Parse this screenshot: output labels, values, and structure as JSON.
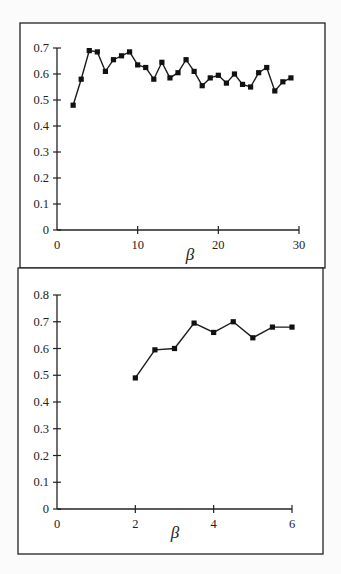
{
  "chart_data": [
    {
      "type": "line",
      "title": "",
      "xlabel": "β",
      "ylabel": "",
      "xlim": [
        0,
        30
      ],
      "ylim": [
        0,
        0.7
      ],
      "xticks": [
        0,
        10,
        20,
        30
      ],
      "yticks": [
        0,
        0.1,
        0.2,
        0.3,
        0.4,
        0.5,
        0.6,
        0.7
      ],
      "grid": false,
      "legend": null,
      "marker": "square",
      "series": [
        {
          "name": "top",
          "x": [
            2,
            3,
            4,
            5,
            6,
            7,
            8,
            9,
            10,
            11,
            12,
            13,
            14,
            15,
            16,
            17,
            18,
            19,
            20,
            21,
            22,
            23,
            24,
            25,
            26,
            27,
            28,
            29
          ],
          "y": [
            0.48,
            0.58,
            0.69,
            0.685,
            0.61,
            0.655,
            0.67,
            0.685,
            0.635,
            0.625,
            0.58,
            0.645,
            0.585,
            0.605,
            0.655,
            0.61,
            0.555,
            0.585,
            0.595,
            0.565,
            0.6,
            0.56,
            0.55,
            0.605,
            0.625,
            0.535,
            0.57,
            0.585
          ]
        }
      ]
    },
    {
      "type": "line",
      "title": "",
      "xlabel": "β",
      "ylabel": "",
      "xlim": [
        0,
        6
      ],
      "ylim": [
        0,
        0.8
      ],
      "xticks": [
        0,
        2,
        4,
        6
      ],
      "yticks": [
        0,
        0.1,
        0.2,
        0.3,
        0.4,
        0.5,
        0.6,
        0.7,
        0.8
      ],
      "grid": false,
      "legend": null,
      "marker": "square",
      "series": [
        {
          "name": "bottom",
          "x": [
            2,
            2.5,
            3,
            3.5,
            4,
            4.5,
            5,
            5.5,
            6
          ],
          "y": [
            0.49,
            0.595,
            0.6,
            0.695,
            0.66,
            0.7,
            0.64,
            0.68,
            0.68
          ]
        }
      ]
    }
  ],
  "top_chart": {
    "ytick_labels": [
      "0",
      "0.1",
      "0.2",
      "0.3",
      "0.4",
      "0.5",
      "0.6",
      "0.7"
    ],
    "xtick_labels": [
      "0",
      "10",
      "20",
      "30"
    ],
    "xlabel": "β"
  },
  "bottom_chart": {
    "ytick_labels": [
      "0",
      "0.1",
      "0.2",
      "0.3",
      "0.4",
      "0.5",
      "0.6",
      "0.7",
      "0.8"
    ],
    "xtick_labels": [
      "0",
      "2",
      "4",
      "6"
    ],
    "xlabel": "β"
  }
}
